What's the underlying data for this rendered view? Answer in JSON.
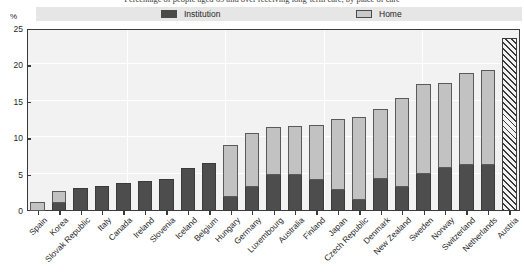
{
  "figure": {
    "title_cropped": "Percentage of people aged 65 and over receiving long-term care, by place of care",
    "unit_label": "%"
  },
  "legend": {
    "position": "top",
    "entries": [
      {
        "label": "Institution",
        "color": "#4d4d4d",
        "icon": "legend-swatch-dark"
      },
      {
        "label": "Home",
        "color": "#c2c2c2",
        "icon": "legend-swatch-light"
      }
    ]
  },
  "chart_data": {
    "type": "bar",
    "subtype": "stacked-vertical",
    "title": "Percentage of people aged 65 and over receiving long-term care, by place of care",
    "xlabel": "",
    "ylabel": "%",
    "ylim": [
      0,
      25
    ],
    "yticks": [
      0,
      5,
      10,
      15,
      20,
      25
    ],
    "grid": true,
    "legend_position": "top",
    "categories": [
      "Spain",
      "Korea",
      "Slovak Republic",
      "Italy",
      "Canada",
      "Ireland",
      "Slovenia",
      "Iceland",
      "Belgium",
      "Hungary",
      "Germany",
      "Luxembourg",
      "Australia",
      "Finland",
      "Japan",
      "Czech Republic",
      "Denmark",
      "New Zealand",
      "Sweden",
      "Norway",
      "Switzerland",
      "Netherlands",
      "Austria"
    ],
    "series": [
      {
        "name": "Institution",
        "color": "#4d4d4d",
        "values": [
          0.2,
          1.2,
          3.2,
          3.5,
          3.8,
          4.1,
          4.4,
          5.9,
          6.6,
          2.1,
          3.4,
          5.1,
          5.1,
          4.4,
          3.0,
          1.6,
          4.5,
          3.4,
          5.2,
          6.1,
          6.4,
          6.5,
          null
        ]
      },
      {
        "name": "Home",
        "color": "#c2c2c2",
        "values": [
          1.1,
          1.5,
          0.0,
          0.0,
          0.0,
          0.0,
          0.0,
          0.0,
          0.0,
          7.0,
          7.3,
          6.5,
          6.6,
          7.4,
          9.7,
          11.3,
          9.5,
          12.1,
          12.3,
          11.5,
          12.5,
          12.9,
          null
        ]
      },
      {
        "name": "Total (not split by place of care)",
        "color": "hatched",
        "values": [
          null,
          null,
          null,
          null,
          null,
          null,
          null,
          null,
          null,
          null,
          null,
          null,
          null,
          null,
          null,
          null,
          null,
          null,
          null,
          null,
          null,
          null,
          23.7
        ]
      }
    ],
    "totals": [
      1.3,
      2.7,
      3.2,
      3.5,
      3.8,
      4.1,
      4.4,
      5.9,
      6.6,
      9.1,
      10.7,
      11.6,
      11.7,
      11.8,
      12.7,
      12.9,
      14.0,
      15.5,
      17.5,
      17.6,
      18.9,
      19.4,
      23.7
    ]
  }
}
